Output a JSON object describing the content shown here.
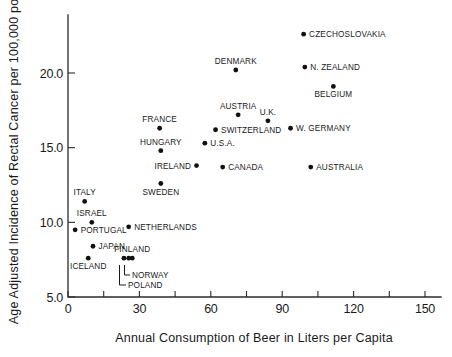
{
  "chart_data": {
    "type": "scatter",
    "title": "",
    "xlabel": "Annual Consumption of Beer in Liters per Capita",
    "ylabel": "Age Adjusted Incidence of Rectal Cancer per 100,000 pop.",
    "xlim": [
      0,
      156
    ],
    "ylim": [
      5.0,
      23.4
    ],
    "grid": false,
    "legend": "none",
    "x_ticks": [
      0,
      15,
      30,
      45,
      60,
      75,
      90,
      105,
      120,
      135,
      150
    ],
    "x_tick_labels": [
      "0",
      "",
      "30",
      "",
      "60",
      "",
      "90",
      "",
      "120",
      "",
      "150"
    ],
    "y_ticks": [
      5.0,
      10.0,
      15.0,
      20.0
    ],
    "y_tick_labels": [
      "5.0",
      "10.0",
      "15.0",
      "20.0"
    ],
    "points": [
      {
        "name": "CZECHOSLOVAKIA",
        "x": 99.0,
        "y": 22.6,
        "label_pos": "right"
      },
      {
        "name": "DENMARK",
        "x": 70.5,
        "y": 20.2,
        "label_pos": "above"
      },
      {
        "name": "N. ZEALAND",
        "x": 99.5,
        "y": 20.4,
        "label_pos": "right"
      },
      {
        "name": "BELGIUM",
        "x": 111.5,
        "y": 19.1,
        "label_pos": "below"
      },
      {
        "name": "AUSTRIA",
        "x": 71.5,
        "y": 17.2,
        "label_pos": "above"
      },
      {
        "name": "U.K.",
        "x": 84.0,
        "y": 16.8,
        "label_pos": "above"
      },
      {
        "name": "W. GERMANY",
        "x": 93.5,
        "y": 16.3,
        "label_pos": "right"
      },
      {
        "name": "SWITZERLAND",
        "x": 62.0,
        "y": 16.2,
        "label_pos": "right"
      },
      {
        "name": "FRANCE",
        "x": 38.5,
        "y": 16.3,
        "label_pos": "above"
      },
      {
        "name": "U.S.A.",
        "x": 57.5,
        "y": 15.3,
        "label_pos": "right"
      },
      {
        "name": "HUNGARY",
        "x": 39.0,
        "y": 14.8,
        "label_pos": "above"
      },
      {
        "name": "IRELAND",
        "x": 54.0,
        "y": 13.8,
        "label_pos": "left"
      },
      {
        "name": "CANADA",
        "x": 65.0,
        "y": 13.7,
        "label_pos": "right"
      },
      {
        "name": "AUSTRALIA",
        "x": 102.0,
        "y": 13.7,
        "label_pos": "right"
      },
      {
        "name": "SWEDEN",
        "x": 39.0,
        "y": 12.6,
        "label_pos": "below"
      },
      {
        "name": "ITALY",
        "x": 7.0,
        "y": 11.4,
        "label_pos": "above"
      },
      {
        "name": "ISRAEL",
        "x": 10.0,
        "y": 10.0,
        "label_pos": "above"
      },
      {
        "name": "NETHERLANDS",
        "x": 25.5,
        "y": 9.7,
        "label_pos": "right"
      },
      {
        "name": "PORTUGAL",
        "x": 3.0,
        "y": 9.5,
        "label_pos": "right"
      },
      {
        "name": "JAPAN",
        "x": 10.5,
        "y": 8.4,
        "label_pos": "right"
      },
      {
        "name": "ICELAND",
        "x": 8.5,
        "y": 7.6,
        "label_pos": "below"
      },
      {
        "name": "POLAND",
        "x": 23.5,
        "y": 7.6,
        "label_pos": "leader"
      },
      {
        "name": "NORWAY",
        "x": 25.5,
        "y": 7.6,
        "label_pos": "leader"
      },
      {
        "name": "FINLAND",
        "x": 27.0,
        "y": 7.6,
        "label_pos": "above"
      }
    ]
  },
  "axes": {
    "x_title": "Annual Consumption of Beer in Liters per Capita",
    "y_title": "Age Adjusted Incidence of Rectal Cancer per 100,000 pop.",
    "y_labels": [
      "20.0",
      "15.0",
      "10.0",
      "5.0"
    ],
    "x_labels": [
      "0",
      "30",
      "60",
      "90",
      "120",
      "150"
    ]
  },
  "colors": {
    "marker": "#111111",
    "axis": "#2b2b2b",
    "text": "#1a1a1a",
    "background": "#ffffff"
  }
}
